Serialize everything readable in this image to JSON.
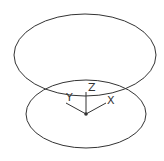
{
  "diagram": {
    "type": "3d-coordinate-system",
    "stroke_color": "#333333",
    "background": "#ffffff",
    "top_ellipse": {
      "cx": 85,
      "cy": 55,
      "rx": 71,
      "ry": 41
    },
    "bottom_ellipse": {
      "cx": 86,
      "cy": 114,
      "rx": 60,
      "ry": 34
    },
    "origin": {
      "x": 86,
      "y": 114
    },
    "axes": {
      "z": {
        "label": "Z",
        "x2": 86,
        "y2": 92,
        "lx": 88,
        "ly": 91
      },
      "y": {
        "label": "Y",
        "x2": 66,
        "y2": 103,
        "lx": 66,
        "ly": 101
      },
      "x": {
        "label": "X",
        "x2": 106,
        "y2": 103,
        "lx": 107,
        "ly": 104
      }
    }
  }
}
